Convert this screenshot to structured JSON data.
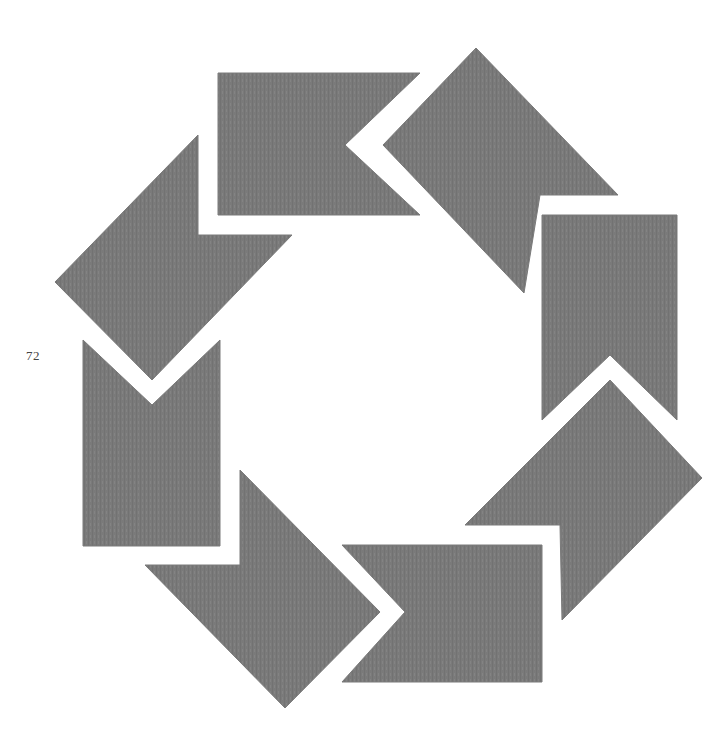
{
  "page": {
    "number": "72"
  },
  "emblem": {
    "description": "Octagonal ring of eight interlocking gray chevron/arrow shapes",
    "fill_color": "#7a7a7a",
    "background_color": "#ffffff",
    "shapes": [
      {
        "id": "top-rect-chevron",
        "points": "218,73 420,73 345,145 420,215 218,215"
      },
      {
        "id": "top-right-diamond",
        "points": "476,48 618,195 540,195 524,293 383,145"
      },
      {
        "id": "right-rect-chevron",
        "points": "542,215 677,215 677,420 610,355 542,420"
      },
      {
        "id": "lower-right-diamond",
        "points": "610,380 702,478 562,620 560,525 465,525"
      },
      {
        "id": "bottom-rect-chevron",
        "points": "342,545 542,545 542,682 342,682 405,612"
      },
      {
        "id": "lower-left-diamond",
        "points": "240,470 380,612 285,708 145,565 240,565"
      },
      {
        "id": "left-rect-chevron",
        "points": "83,340 152,405 220,340 220,546 83,546"
      },
      {
        "id": "upper-left-diamond",
        "points": "198,135 198,235 292,235 152,380 55,282"
      }
    ]
  }
}
